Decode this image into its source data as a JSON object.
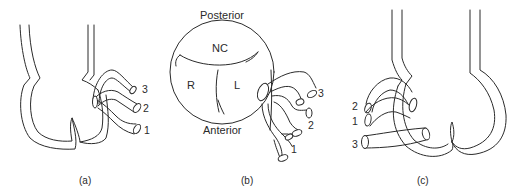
{
  "figure": {
    "panels": [
      {
        "id": "a",
        "caption": "(a)",
        "catheter_labels": [
          "3",
          "2",
          "1"
        ]
      },
      {
        "id": "b",
        "caption": "(b)",
        "orientation_labels": {
          "top": "Posterior",
          "bottom": "Anterior"
        },
        "cusp_labels": {
          "noncoronary": "NC",
          "right": "R",
          "left": "L"
        },
        "catheter_labels": [
          "3",
          "2",
          "1"
        ]
      },
      {
        "id": "c",
        "caption": "(c)",
        "catheter_labels": [
          "2",
          "1",
          "3"
        ]
      }
    ],
    "colors": {
      "line": "#2a2a2a",
      "background": "#ffffff"
    }
  }
}
